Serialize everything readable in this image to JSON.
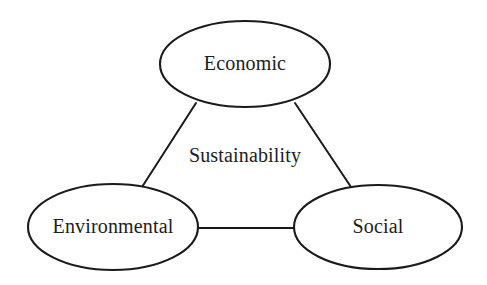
{
  "diagram": {
    "title": "Sustainability",
    "type": "venn-triad-diagram",
    "background_color": "#ffffff",
    "stroke_color": "#1a1a1a",
    "text_color": "#1c1c1c",
    "center_label": {
      "text": "Sustainability",
      "cx": 245,
      "cy": 157
    },
    "nodes": [
      {
        "id": "economic",
        "label": "Economic",
        "cx": 245,
        "cy": 64,
        "rx": 85,
        "ry": 43
      },
      {
        "id": "environmental",
        "label": "Environmental",
        "cx": 113,
        "cy": 227,
        "rx": 85,
        "ry": 43
      },
      {
        "id": "social",
        "label": "Social",
        "cx": 378,
        "cy": 227,
        "rx": 84,
        "ry": 42
      }
    ],
    "links": [
      {
        "id": "economic-environmental",
        "from": "economic",
        "to": "environmental",
        "x1": 196,
        "y1": 103,
        "x2": 142,
        "y2": 187
      },
      {
        "id": "economic-social",
        "from": "economic",
        "to": "social",
        "x1": 295,
        "y1": 103,
        "x2": 351,
        "y2": 187
      },
      {
        "id": "environmental-social",
        "from": "environmental",
        "to": "social",
        "x1": 197,
        "y1": 228,
        "x2": 296,
        "y2": 228
      }
    ]
  }
}
